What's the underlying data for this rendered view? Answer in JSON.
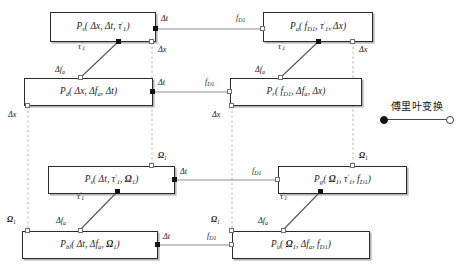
{
  "diagram": {
    "legend": {
      "label": "傅里叶变换",
      "source_marker": "filled-square",
      "target_marker": "hollow-square",
      "accent_color": "#111111",
      "line_color": "#4a4a4a"
    },
    "nodes": [
      {
        "id": "n1",
        "name": "node-ps-dx-dt-tau",
        "symbol": "P",
        "symbol_sub": "s",
        "args": "( Δx, Δt, τ′₁ )"
      },
      {
        "id": "n2",
        "name": "node-pa-fd1-tau-dx",
        "symbol": "P",
        "symbol_sub": "a",
        "args": "( f₀₁, τ′₁, Δx )"
      },
      {
        "id": "n3",
        "name": "node-pd-dx-dfa-dt",
        "symbol": "P",
        "symbol_sub": "d",
        "args": "( Δx, Δfₐ, Δt )"
      },
      {
        "id": "n4",
        "name": "node-pr-fd1-dfa-dx",
        "symbol": "P",
        "symbol_sub": "r",
        "args": "( f₀₁, Δfₐ, Δx )"
      },
      {
        "id": "n5",
        "name": "node-ps-dt-tau-om",
        "symbol": "P",
        "symbol_sub": "s",
        "args": "( Δt, τ′₁, Ω₁ )"
      },
      {
        "id": "n6",
        "name": "node-pg-om-tau-fd1",
        "symbol": "P",
        "symbol_sub": "g",
        "args": "( Ω₁, τ′₁, f₀₁ )"
      },
      {
        "id": "n7",
        "name": "node-pbl-dt-dfa-om",
        "symbol": "P",
        "symbol_sub": "bl",
        "args": "( Δt, Δfₐ, Ω₁ )"
      },
      {
        "id": "n8",
        "name": "node-pu-om-dfa-fd1",
        "symbol": "P",
        "symbol_sub": "u",
        "args": "( Ω₁, Δfₐ, f₀₁ )"
      }
    ],
    "variables": {
      "delta_t": "Δt",
      "delta_x": "Δx",
      "delta_fa": "Δfₐ",
      "tau_1": "τ′₁",
      "f_d1": "f₀₁",
      "omega_1": "Ω₁"
    },
    "edge_labels": [
      {
        "name": "label-dt-r1-left",
        "text": "Δt"
      },
      {
        "name": "label-fd1-r1-right",
        "text": "f₀₁"
      },
      {
        "name": "label-tau-r1-left",
        "text": "τ′₁"
      },
      {
        "name": "label-dfa-r1-left",
        "text": "Δfₐ"
      },
      {
        "name": "label-dx-r1-mid",
        "text": "Δx"
      },
      {
        "name": "label-dx-r1-right",
        "text": "Δx"
      },
      {
        "name": "label-dt-r2-left",
        "text": "Δt"
      },
      {
        "name": "label-fd1-r2-right",
        "text": "f₀₁"
      },
      {
        "name": "label-tau-r2-right",
        "text": "τ′₁"
      },
      {
        "name": "label-dfa-r2-right",
        "text": "Δfₐ"
      },
      {
        "name": "label-dx-r2-left",
        "text": "Δx"
      },
      {
        "name": "label-om-r3-mid",
        "text": "Ω₁"
      },
      {
        "name": "label-om-r3-right",
        "text": "Ω₁"
      },
      {
        "name": "label-om-r4-left",
        "text": "Ω₁"
      },
      {
        "name": "label-om-r4-mid",
        "text": "Ω₁"
      },
      {
        "name": "label-dt-r3-left",
        "text": "Δt"
      },
      {
        "name": "label-fd1-r3-right",
        "text": "f₀₁"
      },
      {
        "name": "label-dt-r4-left",
        "text": "Δt"
      },
      {
        "name": "label-fd1-r4-right",
        "text": "f₀₁"
      },
      {
        "name": "label-tau-r3-left",
        "text": "τ′₁"
      },
      {
        "name": "label-dfa-r3-left",
        "text": "Δfₐ"
      },
      {
        "name": "label-tau-r3-right",
        "text": "τ′₁"
      },
      {
        "name": "label-dfa-r3-rt",
        "text": "Δfₐ"
      },
      {
        "name": "label-om-r4-left2",
        "text": "Ω₁"
      }
    ]
  }
}
